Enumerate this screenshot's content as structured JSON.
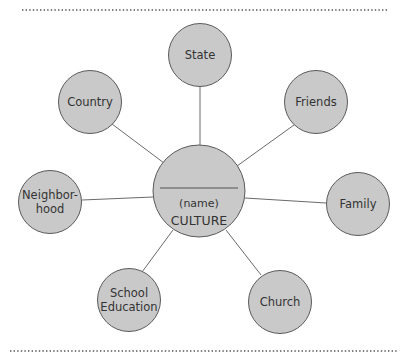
{
  "diagram": {
    "type": "hub-and-spoke",
    "colors": {
      "node_fill": "#c9c9c9",
      "node_stroke": "#5a5a5a",
      "edge": "#6a6a6a",
      "text": "#333333",
      "divider": "#555555"
    },
    "center": {
      "blank_line": "",
      "name_placeholder": "(name)",
      "title": "CULTURE"
    },
    "nodes": [
      {
        "id": "state",
        "label_lines": [
          "State"
        ]
      },
      {
        "id": "friends",
        "label_lines": [
          "Friends"
        ]
      },
      {
        "id": "family",
        "label_lines": [
          "Family"
        ]
      },
      {
        "id": "church",
        "label_lines": [
          "Church"
        ]
      },
      {
        "id": "school-education",
        "label_lines": [
          "School",
          "Education"
        ]
      },
      {
        "id": "neighborhood",
        "label_lines": [
          "Neighbor-",
          "hood"
        ]
      },
      {
        "id": "country",
        "label_lines": [
          "Country"
        ]
      }
    ]
  }
}
